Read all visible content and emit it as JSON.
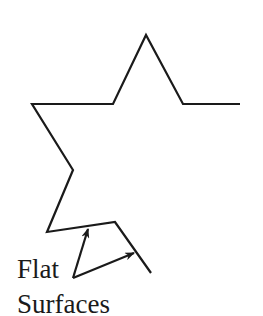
{
  "diagram": {
    "type": "line-drawing",
    "stroke_color": "#1a1a1a",
    "background": "#ffffff",
    "outline_points": [
      [
        240,
        104
      ],
      [
        183,
        104
      ],
      [
        146,
        35
      ],
      [
        113,
        104
      ],
      [
        32,
        104
      ],
      [
        73,
        170
      ],
      [
        47,
        232
      ],
      [
        115,
        222
      ],
      [
        151,
        273
      ]
    ],
    "arrows": [
      {
        "from": [
          73,
          278
        ],
        "to": [
          88,
          229
        ],
        "target": "flat-surface-bottom-edge"
      },
      {
        "from": [
          73,
          278
        ],
        "to": [
          134,
          253
        ],
        "target": "flat-surface-slanted-edge"
      }
    ],
    "label": {
      "line1": "Flat",
      "line2": "Surfaces"
    }
  }
}
